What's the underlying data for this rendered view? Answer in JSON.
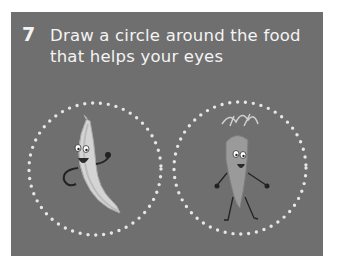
{
  "exercise": {
    "number": "7",
    "instruction_line1": "Draw a circle around the food",
    "instruction_line2": "that helps your eyes"
  },
  "options": [
    {
      "name": "banana",
      "icon": "banana-character-icon"
    },
    {
      "name": "carrot",
      "icon": "carrot-character-icon"
    }
  ],
  "colors": {
    "panel": "#6f6f6f",
    "text": "#f4f4f4",
    "dots": "#e6e6e6"
  }
}
